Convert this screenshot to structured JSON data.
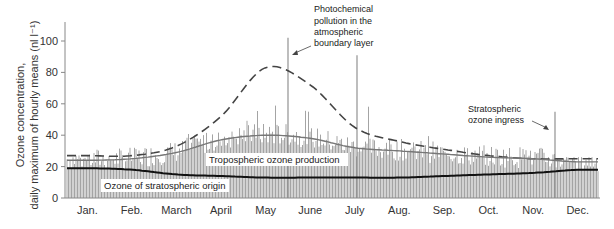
{
  "chart_data": {
    "type": "bar",
    "title": "",
    "ylabel_line1": "Ozone concentration,",
    "ylabel_line2": "daily maximum of hourly means (nl l⁻¹)",
    "xlabel": "",
    "ylim": [
      0,
      110
    ],
    "yticks": [
      0,
      20,
      40,
      60,
      80,
      100
    ],
    "categories": [
      "Jan.",
      "Feb.",
      "March",
      "April",
      "May",
      "June",
      "July",
      "Aug.",
      "Sep.",
      "Oct.",
      "Nov.",
      "Dec."
    ],
    "bar_series_name": "Daily maximum of hourly means",
    "monthly_bar_range": [
      {
        "month": "Jan.",
        "min": 5,
        "max": 32
      },
      {
        "month": "Feb.",
        "min": 10,
        "max": 32
      },
      {
        "month": "March",
        "min": 15,
        "max": 42
      },
      {
        "month": "April",
        "min": 20,
        "max": 45
      },
      {
        "month": "May",
        "min": 22,
        "max": 102
      },
      {
        "month": "June",
        "min": 20,
        "max": 58
      },
      {
        "month": "July",
        "min": 15,
        "max": 91
      },
      {
        "month": "Aug.",
        "min": 15,
        "max": 38
      },
      {
        "month": "Sep.",
        "min": 15,
        "max": 40
      },
      {
        "month": "Oct.",
        "min": 15,
        "max": 36
      },
      {
        "month": "Nov.",
        "min": 15,
        "max": 55
      },
      {
        "month": "Dec.",
        "min": 2,
        "max": 26
      }
    ],
    "series": [
      {
        "name": "Photochemical pollution envelope (dashed)",
        "style": "dashed",
        "values": [
          27,
          27,
          33,
          52,
          83,
          72,
          45,
          36,
          31,
          27,
          25,
          25
        ]
      },
      {
        "name": "Tropospheric ozone production",
        "style": "solid-gray",
        "values": [
          24,
          25,
          29,
          37,
          40,
          38,
          32,
          30,
          28,
          26,
          25,
          23
        ]
      },
      {
        "name": "Ozone of stratospheric origin",
        "style": "solid-black",
        "values": [
          19,
          18,
          15,
          14,
          13,
          13,
          13,
          13,
          14,
          15,
          16,
          18
        ]
      }
    ],
    "spikes": [
      {
        "month": "May",
        "value": 102
      },
      {
        "month": "July",
        "value": 91
      },
      {
        "month": "Nov.",
        "value": 55
      }
    ],
    "annotations": [
      {
        "text_lines": [
          "Photochemical",
          "pollution in the",
          "atmospheric",
          "boundary layer"
        ],
        "points_to": "dashed curve peak (May)"
      },
      {
        "text_lines": [
          "Stratospheric",
          "ozone ingress"
        ],
        "points_to": "November spike"
      },
      {
        "text": "Tropospheric ozone production"
      },
      {
        "text": "Ozone of stratospheric origin"
      }
    ],
    "grid": false,
    "legend": "none (inline labels)"
  },
  "labels": {
    "photochem": [
      "Photochemical",
      "pollution in the",
      "atmospheric",
      "boundary layer"
    ],
    "strat_ingress": [
      "Stratospheric",
      "ozone ingress"
    ],
    "tropo": "Tropospheric ozone production",
    "strat_origin": "Ozone of stratospheric origin"
  },
  "colors": {
    "bars": "#9a9a9a",
    "dashed": "#444444",
    "tropo_line": "#777777",
    "strat_line": "#111111",
    "axis": "#888888"
  }
}
